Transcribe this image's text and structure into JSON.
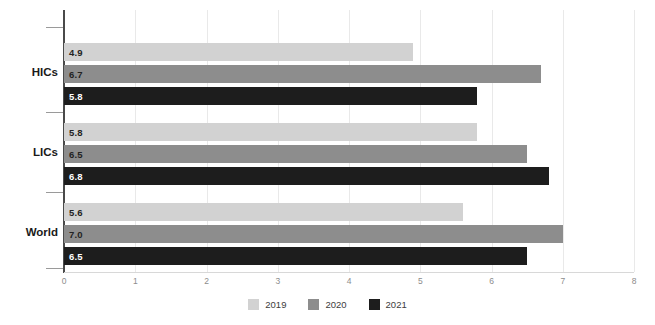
{
  "chart_data": {
    "type": "bar",
    "orientation": "horizontal",
    "title": "",
    "xlabel": "",
    "ylabel": "",
    "categories": [
      "HICs",
      "LICs",
      "World"
    ],
    "series": [
      {
        "name": "2019",
        "color": "#d2d2d2",
        "values": [
          4.9,
          5.8,
          5.6
        ]
      },
      {
        "name": "2020",
        "color": "#8d8d8d",
        "values": [
          6.7,
          6.5,
          7.0
        ]
      },
      {
        "name": "2021",
        "color": "#1d1d1d",
        "values": [
          5.8,
          6.8,
          6.5
        ]
      }
    ],
    "data_labels": {
      "HICs": {
        "2019": "4.9",
        "2020": "6.7",
        "2021": "5.8"
      },
      "LICs": {
        "2019": "5.8",
        "2020": "6.5",
        "2021": "6.8"
      },
      "World": {
        "2019": "5.6",
        "2020": "7.0",
        "2021": "6.5"
      }
    },
    "xlim": [
      0,
      8
    ],
    "xticks": [
      0,
      1,
      2,
      3,
      4,
      5,
      6,
      7,
      8
    ],
    "xtick_labels": [
      "0",
      "1",
      "2",
      "3",
      "4",
      "5",
      "6",
      "7",
      "8"
    ],
    "grid": true,
    "grid_axis": "x",
    "legend_position": "bottom",
    "legend_entries": [
      "2019",
      "2020",
      "2021"
    ]
  },
  "axis": {
    "y_tick_count": 4,
    "x_axis_color": "#d8d8d8",
    "y_axis_color": "#4a4a4a",
    "gridline_color": "#e9e9e9",
    "tick_label_color": "#8c8c8c"
  },
  "colors": {
    "background": "#ffffff",
    "series_2019": "#d2d2d2",
    "series_2020": "#8d8d8d",
    "series_2021": "#1d1d1d",
    "label_dark": "#232323",
    "label_light": "#ffffff",
    "category_label": "#1a1a1a"
  }
}
